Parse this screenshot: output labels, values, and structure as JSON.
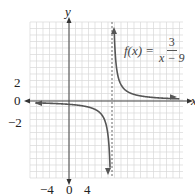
{
  "chart_data": {
    "type": "line",
    "title": "",
    "function_label": {
      "lhs": "f(x) =",
      "numerator": "3",
      "denominator": "x − 9"
    },
    "xlabel": "x",
    "ylabel": "y",
    "x_ticks": [
      {
        "value": -4,
        "label": "−4"
      },
      {
        "value": 0,
        "label": "0"
      },
      {
        "value": 4,
        "label": "4"
      }
    ],
    "y_ticks": [
      {
        "value": 2,
        "label": "2"
      },
      {
        "value": 0,
        "label": "0"
      },
      {
        "value": -2,
        "label": "−2"
      }
    ],
    "vertical_asymptote": 9,
    "horizontal_asymptote": 0,
    "grid": true,
    "series": [
      {
        "name": "left branch (x<9)",
        "x": [
          -8,
          -4,
          0,
          4,
          6,
          7,
          8,
          8.5
        ],
        "y": [
          -0.18,
          -0.23,
          -0.33,
          -0.6,
          -1,
          -1.5,
          -3,
          -6
        ]
      },
      {
        "name": "right branch (x>9)",
        "x": [
          9.4,
          9.6,
          10,
          11,
          12,
          15,
          20,
          24
        ],
        "y": [
          7.5,
          5,
          3,
          1.5,
          1,
          0.5,
          0.27,
          0.2
        ]
      }
    ],
    "colors": {
      "curve": "#555555",
      "axis": "#444444",
      "grid": "#d9d9d9",
      "asymptote": "#666666"
    }
  }
}
